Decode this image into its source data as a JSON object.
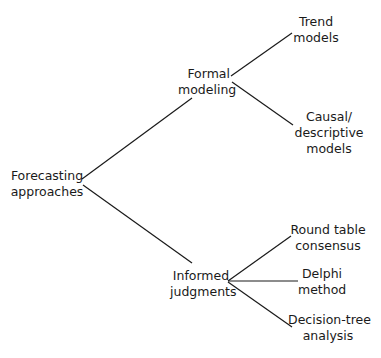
{
  "diagram": {
    "type": "tree",
    "root": {
      "id": "root",
      "lines": [
        "Forecasting",
        "approaches"
      ]
    },
    "branches": [
      {
        "id": "formal",
        "lines": [
          "Formal",
          "modeling"
        ],
        "children": [
          {
            "id": "trend",
            "lines": [
              "Trend",
              "models"
            ]
          },
          {
            "id": "causal",
            "lines": [
              "Causal/",
              "descriptive",
              "models"
            ]
          }
        ]
      },
      {
        "id": "informed",
        "lines": [
          "Informed",
          "judgments"
        ],
        "children": [
          {
            "id": "roundtable",
            "lines": [
              "Round table",
              "consensus"
            ]
          },
          {
            "id": "delphi",
            "lines": [
              "Delphi",
              "method"
            ]
          },
          {
            "id": "decisiontree",
            "lines": [
              "Decision-tree",
              "analysis"
            ]
          }
        ]
      }
    ],
    "edges": [
      [
        "root",
        "formal"
      ],
      [
        "root",
        "informed"
      ],
      [
        "formal",
        "trend"
      ],
      [
        "formal",
        "causal"
      ],
      [
        "informed",
        "roundtable"
      ],
      [
        "informed",
        "delphi"
      ],
      [
        "informed",
        "decisiontree"
      ]
    ],
    "line_color": "#1a1a1a"
  }
}
